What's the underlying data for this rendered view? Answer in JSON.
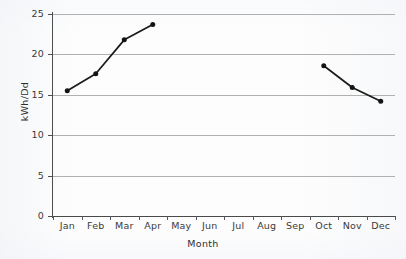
{
  "chart_data": {
    "type": "line",
    "title": "",
    "subtitle": "",
    "xlabel": "Month",
    "ylabel": "kWh/Dd",
    "categories": [
      "Jan",
      "Feb",
      "Mar",
      "Apr",
      "May",
      "Jun",
      "Jul",
      "Aug",
      "Sep",
      "Oct",
      "Nov",
      "Dec"
    ],
    "series": [
      {
        "name": "kWh/Dd",
        "values": [
          15.5,
          17.6,
          21.8,
          23.7,
          null,
          null,
          null,
          null,
          null,
          18.6,
          15.9,
          14.2
        ]
      }
    ],
    "ylim": [
      0,
      25
    ],
    "yticks": [
      0,
      5,
      10,
      15,
      20,
      25
    ],
    "ytick_labels": [
      "0",
      "5",
      "10",
      "15",
      "20",
      "25"
    ],
    "grid": "horizontal",
    "legend": "none",
    "marker": "filled-circle",
    "line_color": "#1a1a1a",
    "marker_color": "#141414",
    "gridline_color": "#aeb0b2",
    "axis_color": "#4d4d4d",
    "background_color": "#fdfdfd"
  }
}
